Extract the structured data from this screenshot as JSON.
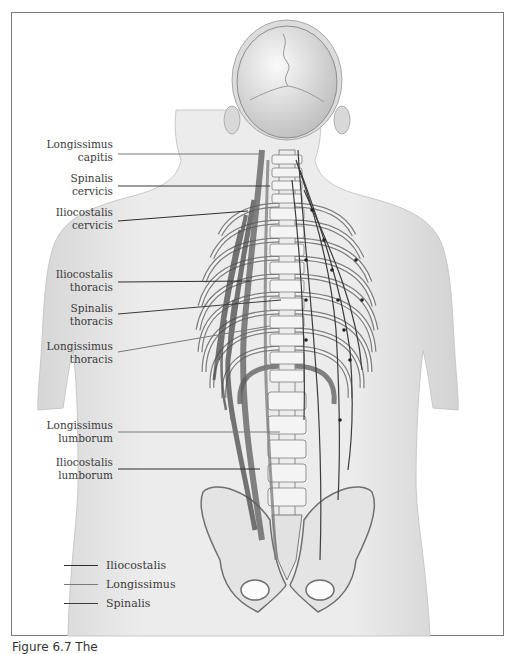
{
  "figure": {
    "labels": [
      {
        "id": "longissimus-capitis",
        "line1": "Longissimus",
        "line2": "capitis",
        "top": 138,
        "line": {
          "x1": 118,
          "y1": 154,
          "x2": 264,
          "y2": 154
        },
        "group": "longissimus"
      },
      {
        "id": "spinalis-cervicis",
        "line1": "Spinalis",
        "line2": "cervicis",
        "top": 172,
        "line": {
          "x1": 118,
          "y1": 186,
          "x2": 270,
          "y2": 186
        },
        "group": "spinalis"
      },
      {
        "id": "iliocostalis-cervicis",
        "line1": "Iliocostalis",
        "line2": "cervicis",
        "top": 206,
        "line": {
          "x1": 118,
          "y1": 221,
          "x2": 248,
          "y2": 211
        },
        "group": "iliocostalis"
      },
      {
        "id": "iliocostalis-thoracis",
        "line1": "Iliocostalis",
        "line2": "thoracis",
        "top": 268,
        "line": {
          "x1": 118,
          "y1": 282,
          "x2": 250,
          "y2": 281
        },
        "group": "iliocostalis"
      },
      {
        "id": "spinalis-thoracis",
        "line1": "Spinalis",
        "line2": "thoracis",
        "top": 302,
        "line": {
          "x1": 118,
          "y1": 314,
          "x2": 281,
          "y2": 300
        },
        "group": "spinalis"
      },
      {
        "id": "longissimus-thoracis",
        "line1": "Longissimus",
        "line2": "thoracis",
        "top": 340,
        "line": {
          "x1": 118,
          "y1": 352,
          "x2": 270,
          "y2": 326
        },
        "group": "longissimus"
      },
      {
        "id": "longissimus-lumborum",
        "line1": "Longissimus",
        "line2": "lumborum",
        "top": 419,
        "line": {
          "x1": 118,
          "y1": 432,
          "x2": 280,
          "y2": 432
        },
        "group": "longissimus"
      },
      {
        "id": "iliocostalis-lumborum",
        "line1": "Iliocostalis",
        "line2": "lumborum",
        "top": 456,
        "line": {
          "x1": 118,
          "y1": 469,
          "x2": 260,
          "y2": 469
        },
        "group": "iliocostalis"
      }
    ],
    "legend": [
      {
        "label": "Iliocostalis",
        "color": "#2e2e2e"
      },
      {
        "label": "Longissimus",
        "color": "#7a7a7a"
      },
      {
        "label": "Spinalis",
        "color": "#3b3b3b"
      }
    ],
    "colors": {
      "body_fill": "#e6e6e6",
      "body_edge": "#c4c4c4",
      "bone_fill": "#f1f1f1",
      "bone_edge": "#7d7d7d",
      "muscle": "#555555",
      "frame_border": "#7a7a7a",
      "label_text": "#3a3a3a"
    }
  },
  "caption": {
    "text": "Figure 6.7 The"
  }
}
